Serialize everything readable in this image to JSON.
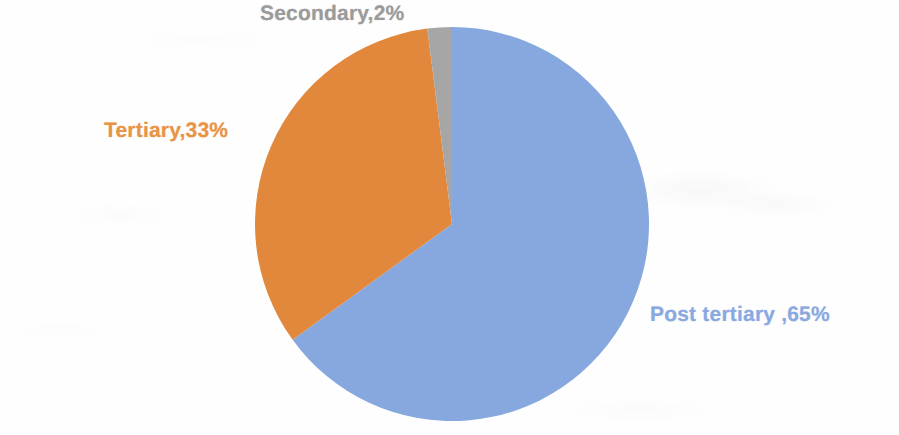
{
  "chart_data": {
    "type": "pie",
    "title": "",
    "subtitle": "",
    "xlabel": "",
    "ylabel": "",
    "legend_position": "none",
    "grid": false,
    "labels_on_slices": true,
    "start_angle_deg": 0,
    "direction": "clockwise",
    "categories": [
      "Post tertiary",
      "Tertiary",
      "Secondary"
    ],
    "values": [
      65,
      33,
      2
    ],
    "units": "percent",
    "total": 100,
    "slices": [
      {
        "name": "Post tertiary",
        "value": 65,
        "label": "Post tertiary ,65%",
        "color": "#87a8de",
        "start_deg": 0,
        "sweep_deg": 234
      },
      {
        "name": "Tertiary",
        "value": 33,
        "label": "Tertiary,33%",
        "color": "#e2883c",
        "start_deg": 234,
        "sweep_deg": 118.8
      },
      {
        "name": "Secondary",
        "value": 2,
        "label": "Secondary,2%",
        "color": "#a6a6a6",
        "start_deg": 352.8,
        "sweep_deg": 7.2
      }
    ]
  },
  "labels": {
    "secondary": "Secondary,2%",
    "tertiary": "Tertiary,33%",
    "post_tertiary": "Post tertiary ,65%"
  },
  "colors": {
    "post_tertiary": "#87a8de",
    "tertiary": "#e2883c",
    "secondary": "#a6a6a6",
    "background": "#ffffff",
    "label_post_tertiary": "#8aa9e0",
    "label_tertiary": "#e79447",
    "label_secondary": "#9b9b9b"
  },
  "geometry": {
    "center_x": 452,
    "center_y": 224,
    "radius": 197
  }
}
